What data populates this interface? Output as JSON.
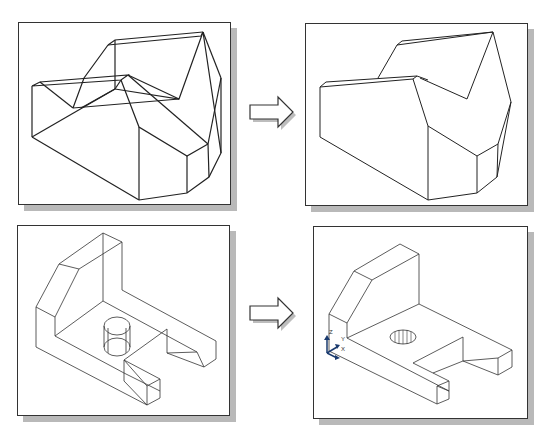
{
  "figure": {
    "panels": [
      {
        "id": "top-left",
        "description": "Wireframe 3D solid (hidden lines visible)"
      },
      {
        "id": "top-right",
        "description": "Same solid with hidden lines removed"
      },
      {
        "id": "bottom-left",
        "description": "Wireframe bracket with cylindrical hole"
      },
      {
        "id": "bottom-right",
        "description": "Bracket with hidden lines removed, hole hatched, UCS icon"
      }
    ],
    "arrows": [
      "right-arrow",
      "right-arrow"
    ],
    "ucs_icon": {
      "z_label": "Z",
      "x_label": "X",
      "y_label": "Y"
    }
  },
  "colors": {
    "line": "#222222",
    "shadow": "#b9b9b9",
    "ucs_blue": "#1a3a6e"
  }
}
